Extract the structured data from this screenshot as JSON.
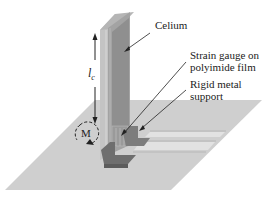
{
  "figure": {
    "labels": {
      "celium": "Celium",
      "strain_gauge_line1": "Strain gauge on",
      "strain_gauge_line2": "polyimide film",
      "support_line1": "Rigid metal",
      "support_line2": "support",
      "length_symbol": "l",
      "length_subscript": "c",
      "moment_symbol": "M"
    },
    "colors": {
      "floor": "#cfcfcf",
      "floor_stripe": "#e2e2e2",
      "floor_line": "#a8a8a8",
      "plate_front": "#a3a3a3",
      "plate_side": "#c4c4c4",
      "plate_inner": "#8f8f8f",
      "support": "#7d7d7d",
      "support_dark": "#666666",
      "text": "#222222"
    }
  }
}
